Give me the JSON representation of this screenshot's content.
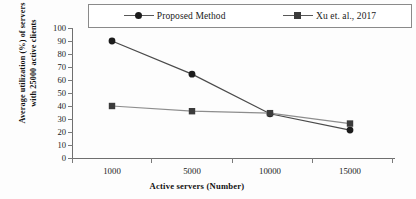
{
  "chart_data": {
    "type": "line",
    "title": "",
    "xlabel": "Active servers (Number)",
    "ylabel": "Average utilization (%) of servers with 25000 active clients",
    "ylabel_line1": "Average utilization (%) of servers",
    "ylabel_line2": "with 25000 active clients",
    "categories": [
      "1000",
      "5000",
      "10000",
      "15000"
    ],
    "x_tick_labels": [
      "1000",
      "5000",
      "10000",
      "15000"
    ],
    "y_tick_labels": [
      "0",
      "10",
      "20",
      "30",
      "40",
      "50",
      "60",
      "70",
      "80",
      "90",
      "100"
    ],
    "ylim": [
      0,
      100
    ],
    "y_tick_step": 10,
    "grid": false,
    "legend_position": "top",
    "series": [
      {
        "name": "Proposed Method",
        "marker": "circle",
        "color": "#1c1c1c",
        "values": [
          90,
          64.5,
          34,
          21.5
        ]
      },
      {
        "name": "Xu et. al., 2017",
        "marker": "square",
        "color": "#3b3b3b",
        "values": [
          40,
          36,
          34.5,
          26.5
        ]
      }
    ]
  },
  "legend": {
    "entries": [
      {
        "label": "Proposed Method",
        "marker": "circle"
      },
      {
        "label": "Xu et. al., 2017",
        "marker": "square"
      }
    ]
  },
  "axes": {
    "y": {
      "ticks": [
        "100",
        "90",
        "80",
        "70",
        "60",
        "50",
        "40",
        "30",
        "20",
        "10",
        "0"
      ],
      "title_line1": "Average utilization (%) of servers",
      "title_line2": "with 25000 active clients"
    },
    "x": {
      "ticks": [
        "1000",
        "5000",
        "10000",
        "15000"
      ],
      "title": "Active servers (Number)"
    }
  },
  "colors": {
    "series_1": "#1c1c1c",
    "series_2": "#3b3b3b",
    "axis": "#6f6f6f",
    "background": "#fdfdfd"
  }
}
